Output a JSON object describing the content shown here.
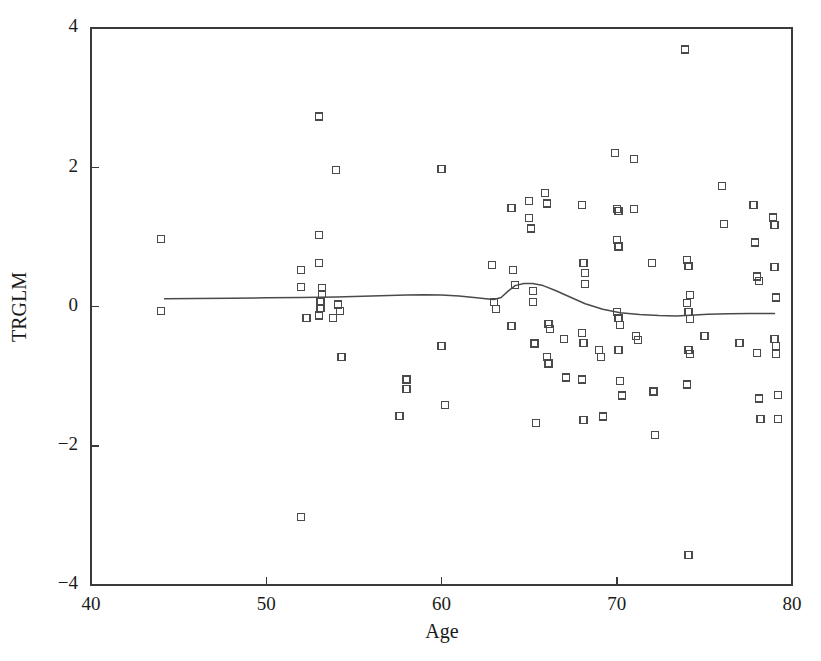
{
  "chart_data": {
    "type": "scatter",
    "title": "",
    "xlabel": "Age",
    "ylabel": "TRGLM",
    "xlim": [
      40,
      80
    ],
    "ylim": [
      -4,
      4
    ],
    "xticks": [
      40,
      50,
      60,
      70,
      80
    ],
    "yticks": [
      4,
      2,
      0,
      -2,
      -4
    ],
    "xtick_labels": [
      "40",
      "50",
      "60",
      "70",
      "80"
    ],
    "ytick_labels": [
      "4",
      "2",
      "0",
      "−2",
      "−4"
    ],
    "grid": false,
    "legend": null,
    "marker_style": "open-square",
    "marker_color": "#4a4a4a",
    "curve_color": "#4a4a4a",
    "series": [
      {
        "name": "TRGLM vs Age",
        "type": "scatter",
        "points": [
          [
            44.0,
            0.97
          ],
          [
            44.0,
            -0.07
          ],
          [
            52.0,
            -3.02
          ],
          [
            52.0,
            0.52
          ],
          [
            52.0,
            0.28
          ],
          [
            52.3,
            -0.17
          ],
          [
            53.0,
            2.73
          ],
          [
            53.0,
            1.03
          ],
          [
            53.0,
            0.63
          ],
          [
            53.2,
            0.27
          ],
          [
            53.2,
            0.18
          ],
          [
            53.1,
            0.06
          ],
          [
            53.1,
            -0.02
          ],
          [
            53.0,
            -0.13
          ],
          [
            53.8,
            -0.17
          ],
          [
            54.0,
            1.96
          ],
          [
            54.1,
            0.03
          ],
          [
            54.2,
            -0.06
          ],
          [
            54.3,
            -0.72
          ],
          [
            57.6,
            -1.57
          ],
          [
            58.0,
            -1.05
          ],
          [
            58.0,
            -1.18
          ],
          [
            60.0,
            1.97
          ],
          [
            60.0,
            -0.57
          ],
          [
            60.2,
            -1.41
          ],
          [
            62.9,
            0.6
          ],
          [
            63.0,
            0.07
          ],
          [
            63.1,
            -0.04
          ],
          [
            64.0,
            1.42
          ],
          [
            64.1,
            0.52
          ],
          [
            64.2,
            0.31
          ],
          [
            64.0,
            -0.28
          ],
          [
            65.0,
            1.52
          ],
          [
            65.0,
            1.27
          ],
          [
            65.1,
            1.12
          ],
          [
            65.2,
            0.22
          ],
          [
            65.2,
            0.07
          ],
          [
            65.3,
            -0.53
          ],
          [
            65.4,
            -1.67
          ],
          [
            65.9,
            1.63
          ],
          [
            66.0,
            1.48
          ],
          [
            66.1,
            -0.25
          ],
          [
            66.2,
            -0.32
          ],
          [
            66.0,
            -0.73
          ],
          [
            66.1,
            -0.82
          ],
          [
            67.0,
            -0.47
          ],
          [
            67.1,
            -1.02
          ],
          [
            68.0,
            1.46
          ],
          [
            68.1,
            0.62
          ],
          [
            68.2,
            0.48
          ],
          [
            68.2,
            0.32
          ],
          [
            68.0,
            -0.38
          ],
          [
            68.1,
            -0.52
          ],
          [
            68.0,
            -1.05
          ],
          [
            68.1,
            -1.63
          ],
          [
            69.0,
            -0.62
          ],
          [
            69.1,
            -0.73
          ],
          [
            69.2,
            -1.58
          ],
          [
            69.9,
            2.21
          ],
          [
            70.0,
            1.4
          ],
          [
            70.1,
            1.37
          ],
          [
            70.0,
            0.96
          ],
          [
            70.1,
            0.86
          ],
          [
            70.0,
            -0.08
          ],
          [
            70.1,
            -0.17
          ],
          [
            70.2,
            -0.27
          ],
          [
            70.1,
            -0.62
          ],
          [
            70.2,
            -1.07
          ],
          [
            70.3,
            -1.28
          ],
          [
            71.0,
            2.12
          ],
          [
            71.0,
            1.4
          ],
          [
            71.1,
            -0.42
          ],
          [
            71.2,
            -0.48
          ],
          [
            72.0,
            0.62
          ],
          [
            72.1,
            -1.22
          ],
          [
            72.2,
            -1.85
          ],
          [
            73.9,
            3.69
          ],
          [
            74.0,
            0.67
          ],
          [
            74.1,
            0.58
          ],
          [
            74.2,
            0.17
          ],
          [
            74.0,
            0.05
          ],
          [
            74.1,
            -0.08
          ],
          [
            74.2,
            -0.18
          ],
          [
            74.1,
            -0.62
          ],
          [
            74.2,
            -0.68
          ],
          [
            74.0,
            -1.12
          ],
          [
            74.1,
            -3.57
          ],
          [
            75.0,
            -0.42
          ],
          [
            76.0,
            1.73
          ],
          [
            76.1,
            1.18
          ],
          [
            77.0,
            -0.52
          ],
          [
            77.8,
            1.46
          ],
          [
            77.9,
            0.92
          ],
          [
            78.0,
            0.43
          ],
          [
            78.1,
            0.37
          ],
          [
            78.0,
            -0.67
          ],
          [
            78.1,
            -1.32
          ],
          [
            78.2,
            -1.62
          ],
          [
            78.9,
            1.28
          ],
          [
            79.0,
            1.17
          ],
          [
            79.0,
            0.57
          ],
          [
            79.1,
            0.13
          ],
          [
            79.0,
            -0.47
          ],
          [
            79.1,
            -0.57
          ],
          [
            79.1,
            -0.68
          ],
          [
            79.2,
            -1.27
          ],
          [
            79.2,
            -1.62
          ]
        ]
      },
      {
        "name": "lowess-smooth",
        "type": "line",
        "points": [
          [
            44.2,
            0.11
          ],
          [
            46.0,
            0.115
          ],
          [
            48.0,
            0.12
          ],
          [
            50.0,
            0.125
          ],
          [
            52.0,
            0.13
          ],
          [
            54.0,
            0.135
          ],
          [
            56.0,
            0.15
          ],
          [
            58.0,
            0.165
          ],
          [
            59.0,
            0.17
          ],
          [
            60.0,
            0.165
          ],
          [
            61.0,
            0.15
          ],
          [
            62.0,
            0.125
          ],
          [
            62.8,
            0.105
          ],
          [
            63.0,
            0.1
          ],
          [
            63.4,
            0.13
          ],
          [
            63.8,
            0.22
          ],
          [
            64.2,
            0.3
          ],
          [
            64.7,
            0.33
          ],
          [
            65.2,
            0.33
          ],
          [
            65.8,
            0.3
          ],
          [
            66.5,
            0.23
          ],
          [
            67.3,
            0.14
          ],
          [
            68.2,
            0.04
          ],
          [
            69.2,
            -0.04
          ],
          [
            70.2,
            -0.09
          ],
          [
            71.3,
            -0.115
          ],
          [
            72.4,
            -0.13
          ],
          [
            73.4,
            -0.135
          ],
          [
            74.2,
            -0.125
          ],
          [
            75.2,
            -0.11
          ],
          [
            76.4,
            -0.105
          ],
          [
            77.6,
            -0.1
          ],
          [
            79.0,
            -0.1
          ]
        ]
      }
    ]
  },
  "axes": {
    "x_title": "Age",
    "y_title": "TRGLM"
  }
}
